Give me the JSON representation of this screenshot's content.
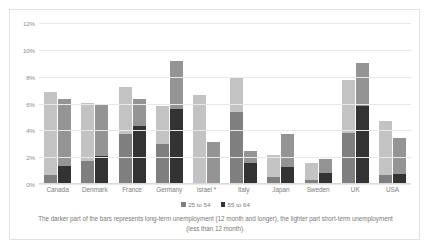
{
  "chart_data": {
    "type": "bar",
    "title": "",
    "subtitle": "",
    "xlabel": "",
    "ylabel": "",
    "ylim": [
      0,
      12
    ],
    "ytick_labels": [
      "12%",
      "10%",
      "8%",
      "6%",
      "4%",
      "2%",
      "0%"
    ],
    "ytick_values": [
      12,
      10,
      8,
      6,
      4,
      2,
      0
    ],
    "grid": true,
    "legend_position": "bottom",
    "stacked": true,
    "categories": [
      "Canada",
      "Denmark",
      "France",
      "Germany",
      "Israel *",
      "Italy",
      "Japan",
      "Sweden",
      "UK",
      "USA"
    ],
    "series": [
      {
        "name": "25 to 54",
        "long_term_values": [
          0.7,
          1.7,
          3.7,
          3.0,
          0.0,
          5.35,
          0.55,
          0.3,
          3.8,
          0.65
        ],
        "short_term_values": [
          6.15,
          4.35,
          3.55,
          2.8,
          6.6,
          2.55,
          1.6,
          1.25,
          3.95,
          4.05
        ],
        "total_values": [
          6.85,
          6.05,
          7.25,
          5.8,
          6.6,
          7.9,
          2.15,
          1.55,
          7.75,
          4.7
        ],
        "color_long_term": "#7f7f7f",
        "color_short_term": "#c3c3c3"
      },
      {
        "name": "55 to 64",
        "long_term_values": [
          1.35,
          2.1,
          4.3,
          5.6,
          0.0,
          1.6,
          1.25,
          0.85,
          5.8,
          0.75
        ],
        "short_term_values": [
          4.95,
          3.85,
          2.0,
          3.6,
          3.1,
          0.85,
          2.45,
          1.0,
          3.25,
          2.7
        ],
        "total_values": [
          6.3,
          5.95,
          6.3,
          9.2,
          3.1,
          2.45,
          3.7,
          1.85,
          9.05,
          3.45
        ],
        "color_long_term": "#333333",
        "color_short_term": "#949494"
      }
    ],
    "legend": [
      {
        "label": "25 to 54",
        "color": "#7f7f7f"
      },
      {
        "label": "55 to 64",
        "color": "#333333"
      }
    ],
    "annotations": [
      "The darker part of the bars represents long-term unemployment (12 month and longer), the lighter part short-term unemployment (less than 12 month)."
    ]
  },
  "caption": {
    "text": "The darker part of the bars represents long-term unemployment (12 month and longer), the lighter part short-term unemployment (less than 12 month)."
  }
}
